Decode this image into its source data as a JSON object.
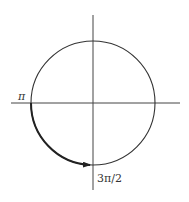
{
  "diagram": {
    "type": "unit-circle",
    "labels": {
      "left_point": "π",
      "bottom_point": "3π/2"
    },
    "arc": {
      "from": "π",
      "to": "3π/2",
      "direction": "counterclockwise",
      "arrow": true
    },
    "colors": {
      "stroke": "#333333",
      "background": "#ffffff"
    }
  }
}
